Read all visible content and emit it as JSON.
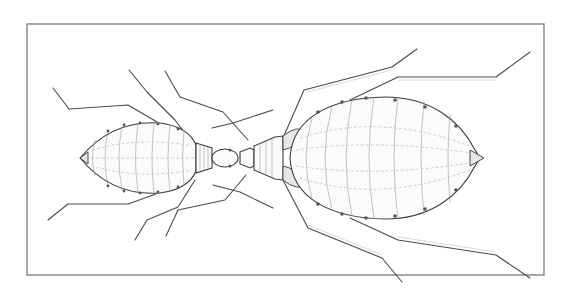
{
  "illustration": {
    "subject": "two aphid-like insects joined head to head, dorsal view line drawing",
    "frame": {
      "x": 27,
      "y": 24,
      "width": 517,
      "height": 251,
      "stroke": "#6f6f6f"
    },
    "small_insect": {
      "body_center": [
        130,
        158
      ],
      "body_length": 110,
      "body_height": 52
    },
    "large_insect": {
      "body_center": [
        385,
        158
      ],
      "body_length": 180,
      "body_height": 122
    },
    "colors": {
      "ink": "#3c3c3c",
      "paper": "#ffffff",
      "shading": "#c8c8c8"
    }
  }
}
